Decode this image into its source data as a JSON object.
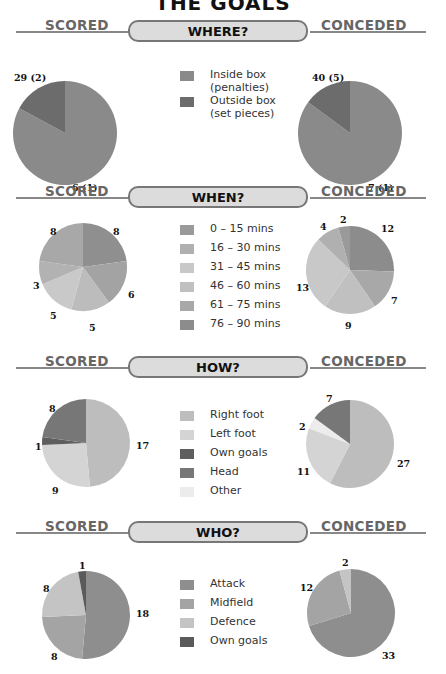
{
  "title": "THE GOALS",
  "labels": {
    "scored": "SCORED",
    "conceded": "CONCEDED"
  },
  "sections": [
    {
      "title": "WHERE?",
      "legend": [
        {
          "label": "Inside box\n(penalties)",
          "color": "#8a8a8a"
        },
        {
          "label": "Outside box\n(set pieces)",
          "color": "#6c6c6c"
        }
      ],
      "scored_labels": [
        "6 (1)",
        "29 (2)"
      ],
      "conceded_labels": [
        "7 (1)",
        "40 (5)"
      ]
    },
    {
      "title": "WHEN?",
      "legend": [
        {
          "label": "0 – 15 mins",
          "color": "#9a9a9a"
        },
        {
          "label": "16 – 30 mins",
          "color": "#b0b0b0"
        },
        {
          "label": "31 – 45 mins",
          "color": "#c8c8c8"
        },
        {
          "label": "46 – 60 mins",
          "color": "#c0c0c0"
        },
        {
          "label": "61 – 75 mins",
          "color": "#a8a8a8"
        },
        {
          "label": "76 – 90 mins",
          "color": "#8c8c8c"
        }
      ],
      "scored_labels": [
        "8",
        "6",
        "5",
        "5",
        "3",
        "8"
      ],
      "conceded_labels": [
        "12",
        "7",
        "9",
        "13",
        "4",
        "2"
      ]
    },
    {
      "title": "HOW?",
      "legend": [
        {
          "label": "Right foot",
          "color": "#bdbdbd"
        },
        {
          "label": "Left foot",
          "color": "#d4d4d4"
        },
        {
          "label": "Own goals",
          "color": "#5e5e5e"
        },
        {
          "label": "Head",
          "color": "#777777"
        },
        {
          "label": "Other",
          "color": "#ececec"
        }
      ],
      "scored_labels": [
        "17",
        "9",
        "1",
        "8"
      ],
      "conceded_labels": [
        "27",
        "11",
        "2",
        "7"
      ]
    },
    {
      "title": "WHO?",
      "legend": [
        {
          "label": "Attack",
          "color": "#8e8e8e"
        },
        {
          "label": "Midfield",
          "color": "#a4a4a4"
        },
        {
          "label": "Defence",
          "color": "#c4c4c4"
        },
        {
          "label": "Own goals",
          "color": "#5a5a5a"
        }
      ],
      "scored_labels": [
        "18",
        "8",
        "8",
        "1"
      ],
      "conceded_labels": [
        "33",
        "12",
        "2"
      ]
    }
  ],
  "chart_data": [
    {
      "type": "pie",
      "title": "WHERE? — Scored",
      "categories": [
        "Inside box (penalties)",
        "Outside box (set pieces)"
      ],
      "values": [
        29,
        6
      ],
      "annotations": [
        "29 (2)",
        "6 (1)"
      ]
    },
    {
      "type": "pie",
      "title": "WHERE? — Conceded",
      "categories": [
        "Inside box (penalties)",
        "Outside box (set pieces)"
      ],
      "values": [
        40,
        7
      ],
      "annotations": [
        "40 (5)",
        "7 (1)"
      ]
    },
    {
      "type": "pie",
      "title": "WHEN? — Scored",
      "categories": [
        "0 – 15 mins",
        "16 – 30 mins",
        "31 – 45 mins",
        "46 – 60 mins",
        "61 – 75 mins",
        "76 – 90 mins"
      ],
      "values": [
        8,
        3,
        5,
        5,
        6,
        8
      ]
    },
    {
      "type": "pie",
      "title": "WHEN? — Conceded",
      "categories": [
        "0 – 15 mins",
        "16 – 30 mins",
        "31 – 45 mins",
        "46 – 60 mins",
        "61 – 75 mins",
        "76 – 90 mins"
      ],
      "values": [
        2,
        4,
        13,
        9,
        7,
        12
      ]
    },
    {
      "type": "pie",
      "title": "HOW? — Scored",
      "categories": [
        "Right foot",
        "Left foot",
        "Own goals",
        "Head",
        "Other"
      ],
      "values": [
        17,
        9,
        1,
        8,
        0
      ]
    },
    {
      "type": "pie",
      "title": "HOW? — Conceded",
      "categories": [
        "Right foot",
        "Left foot",
        "Own goals",
        "Head",
        "Other"
      ],
      "values": [
        27,
        11,
        0,
        7,
        2
      ]
    },
    {
      "type": "pie",
      "title": "WHO? — Scored",
      "categories": [
        "Attack",
        "Midfield",
        "Defence",
        "Own goals"
      ],
      "values": [
        18,
        8,
        8,
        1
      ]
    },
    {
      "type": "pie",
      "title": "WHO? — Conceded",
      "categories": [
        "Attack",
        "Midfield",
        "Defence",
        "Own goals"
      ],
      "values": [
        33,
        12,
        2,
        0
      ]
    }
  ]
}
